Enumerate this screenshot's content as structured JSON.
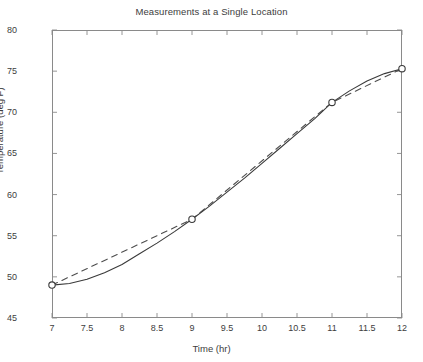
{
  "chart_data": {
    "type": "line",
    "title": "Measurements at a Single Location",
    "xlabel": "Time (hr)",
    "ylabel": "Temperature (deg F)",
    "xlim": [
      7,
      12
    ],
    "ylim": [
      45,
      80
    ],
    "xticks": [
      7,
      7.5,
      8,
      8.5,
      9,
      9.5,
      10,
      10.5,
      11,
      11.5,
      12
    ],
    "xticklabels": [
      "7",
      "7.5",
      "8",
      "8.5",
      "9",
      "9.5",
      "10",
      "10.5",
      "11",
      "11.5",
      "12"
    ],
    "yticks": [
      45,
      50,
      55,
      60,
      65,
      70,
      75,
      80
    ],
    "yticklabels": [
      "45",
      "50",
      "55",
      "60",
      "65",
      "70",
      "75",
      "80"
    ],
    "grid": false,
    "legend": null,
    "marker": "open-circle",
    "series": [
      {
        "name": "measured data",
        "style": "dashed",
        "color": "#4d4d4d",
        "marker": "open-circle",
        "x": [
          7,
          9,
          11,
          12
        ],
        "values": [
          49.0,
          57.0,
          71.2,
          75.3
        ]
      },
      {
        "name": "spline interpolation",
        "style": "solid",
        "color": "#3a3a3a",
        "marker": "none",
        "x": [
          7,
          7.25,
          7.5,
          7.75,
          8,
          8.25,
          8.5,
          8.75,
          9,
          9.25,
          9.5,
          9.75,
          10,
          10.25,
          10.5,
          10.75,
          11,
          11.25,
          11.5,
          11.75,
          12
        ],
        "values": [
          49.0,
          49.2,
          49.7,
          50.5,
          51.5,
          52.8,
          54.1,
          55.5,
          57.0,
          58.6,
          60.3,
          62.0,
          63.8,
          65.6,
          67.4,
          69.2,
          71.2,
          72.6,
          73.8,
          74.7,
          75.3
        ]
      }
    ]
  }
}
